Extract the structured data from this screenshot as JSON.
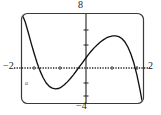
{
  "figure": {
    "kind": "graphing-calculator-screen",
    "caption_mark": "a"
  },
  "labels": {
    "y_max": "8",
    "y_min": "−4",
    "x_min": "−2",
    "x_max": "2"
  },
  "colors": {
    "curve": "#111111",
    "axis": "#222222",
    "frame": "#333333",
    "background": "#ffffff",
    "text": "#1a1a1a"
  },
  "chart_data": {
    "type": "line",
    "title": "",
    "xlabel": "",
    "ylabel": "",
    "xlim": [
      -2,
      2
    ],
    "ylim": [
      -4,
      8
    ],
    "grid": false,
    "legend": null,
    "axis_style": {
      "x_axis": "dotted",
      "y_axis": "solid",
      "tick_marks": "small dotted ticks along both axes",
      "frame": "rounded rectangle viewport border"
    },
    "tick_labels": {
      "x": [
        "-2",
        "2"
      ],
      "y": [
        "-4",
        "8"
      ]
    },
    "series": [
      {
        "name": "cubic",
        "x": [
          -2.0,
          -1.9,
          -1.8,
          -1.7,
          -1.6,
          -1.5,
          -1.4,
          -1.3,
          -1.2,
          -1.1,
          -1.0,
          -0.9,
          -0.8,
          -0.7,
          -0.6,
          -0.5,
          -0.4,
          -0.3,
          -0.2,
          -0.1,
          0.0,
          0.1,
          0.2,
          0.3,
          0.4,
          0.5,
          0.6,
          0.7,
          0.8,
          0.9,
          1.0,
          1.1,
          1.2,
          1.3,
          1.4,
          1.5,
          1.6,
          1.7,
          1.8,
          1.9,
          2.0
        ],
        "y": [
          8.0,
          7.0,
          5.6,
          4.1,
          2.7,
          1.4,
          0.3,
          -0.6,
          -1.3,
          -1.75,
          -2.0,
          -2.1,
          -2.05,
          -1.85,
          -1.55,
          -1.15,
          -0.7,
          -0.2,
          0.35,
          0.9,
          1.45,
          2.0,
          2.55,
          3.05,
          3.5,
          3.9,
          4.25,
          4.55,
          4.8,
          4.95,
          5.05,
          5.05,
          4.95,
          4.7,
          4.25,
          3.55,
          2.6,
          1.35,
          -0.25,
          -2.2,
          -4.4
        ]
      }
    ],
    "features": {
      "local_minimum": {
        "x": -0.92,
        "y": -2.1
      },
      "local_maximum": {
        "x": 1.05,
        "y": 5.05
      },
      "x_intercepts": [
        -1.42,
        -0.26,
        1.78
      ],
      "y_intercept": 1.45
    }
  }
}
